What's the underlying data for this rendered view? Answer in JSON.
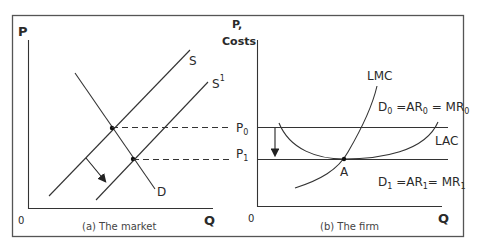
{
  "panels": {
    "market": {
      "caption": "(a) The market",
      "y_axis_label": "P",
      "x_axis_label": "Q",
      "origin_label": "0",
      "curves": {
        "supply": "S",
        "supply_shifted": "S",
        "supply_shifted_sup": "1",
        "demand": "D"
      }
    },
    "firm": {
      "caption": "(b) The firm",
      "y_axis_label_line1": "P,",
      "y_axis_label_line2": "Costs",
      "x_axis_label": "Q",
      "origin_label": "0",
      "price_levels": {
        "p0": "P",
        "p0_sub": "0",
        "p1": "P",
        "p1_sub": "1"
      },
      "curves": {
        "lmc": "LMC",
        "lac": "LAC",
        "d0_parts": [
          "D",
          "0",
          " =AR",
          "0",
          " = MR",
          "0"
        ],
        "d1_parts": [
          "D",
          "1",
          " =AR",
          "1",
          "= MR",
          "1"
        ]
      },
      "point_label": "A"
    }
  },
  "colors": {
    "line": "#333333",
    "border": "#555555",
    "background": "#ffffff"
  }
}
